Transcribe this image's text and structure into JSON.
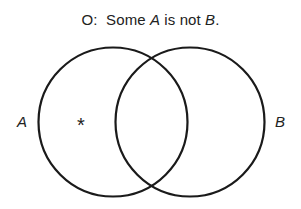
{
  "title": {
    "prefix": "O:  Some ",
    "subject": "A",
    "middle": " is not ",
    "predicate": "B",
    "suffix": "."
  },
  "diagram": {
    "type": "venn",
    "circles": [
      {
        "label": "A",
        "cx": 113,
        "cy": 122,
        "r": 75
      },
      {
        "label": "B",
        "cx": 190,
        "cy": 122,
        "r": 75
      }
    ],
    "marker": {
      "symbol": "*",
      "region": "A-only"
    },
    "stroke_color": "#1a1a1a"
  },
  "labels": {
    "left": "A",
    "right": "B",
    "marker": "*"
  }
}
